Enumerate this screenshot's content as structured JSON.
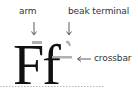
{
  "diagram": {
    "specimen": "Ff",
    "labels": [
      {
        "id": "arm",
        "text": "arm"
      },
      {
        "id": "beak-terminal",
        "text": "beak terminal"
      },
      {
        "id": "crossbar",
        "text": "crossbar"
      }
    ],
    "colors": {
      "glyph": "#111111",
      "highlight": "#a8a8a8",
      "arrow": "#333333",
      "baseline": "#999999"
    }
  }
}
